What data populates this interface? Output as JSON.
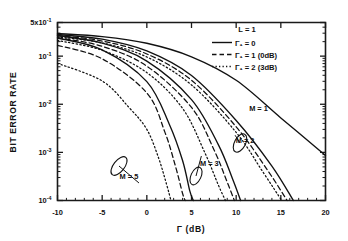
{
  "figure": {
    "background": "#ffffff",
    "ink_color": "#111111"
  },
  "chart_data": {
    "type": "line",
    "title": "",
    "xlabel": "Γ (dB)",
    "ylabel": "BIT ERROR RATE",
    "xlim": [
      -10,
      20
    ],
    "ylim": [
      0.0001,
      0.5
    ],
    "yscale": "log",
    "xticks": [
      -10,
      -5,
      0,
      5,
      10,
      15,
      20
    ],
    "xtick_labels": [
      "-10",
      "-5",
      "0",
      "5",
      "10",
      "15",
      "20"
    ],
    "ytick_values": [
      0.5,
      0.1,
      0.01,
      0.001,
      0.0001
    ],
    "ytick_labels": [
      "5x10",
      "10",
      "10",
      "10",
      "10"
    ],
    "ytick_exponents": [
      "-1",
      "-1",
      "-2",
      "-3",
      "-4"
    ],
    "grid": false,
    "legend_position": "top-right",
    "legend": {
      "header": "L = 1",
      "entries": [
        {
          "label": "Γ₁ = 0",
          "style": "solid"
        },
        {
          "label": "Γ₁ = 1 (0dB)",
          "style": "dashed"
        },
        {
          "label": "Γ₁ = 2 (3dB)",
          "style": "dotted"
        }
      ]
    },
    "annotations": [
      {
        "label": "M = 1",
        "x": 12.5,
        "y": 0.0072
      },
      {
        "label": "M = 2",
        "x": 11.0,
        "y": 0.00155
      },
      {
        "label": "M = 3",
        "x": 7.0,
        "y": 0.00052
      },
      {
        "label": "M = 5",
        "x": -2.0,
        "y": 0.00028
      }
    ],
    "series": [
      {
        "name": "M=1, Γ₁=0",
        "style": "solid",
        "group": "M=1",
        "points": [
          [
            -10,
            0.295
          ],
          [
            -5,
            0.255
          ],
          [
            0,
            0.185
          ],
          [
            5,
            0.097
          ],
          [
            10,
            0.0315
          ],
          [
            15,
            0.0052
          ],
          [
            20,
            0.00086
          ]
        ]
      },
      {
        "name": "M=2, Γ₁=0",
        "style": "solid",
        "group": "M=2",
        "points": [
          [
            -10,
            0.282
          ],
          [
            -5,
            0.225
          ],
          [
            0,
            0.128
          ],
          [
            5,
            0.0395
          ],
          [
            10,
            0.0046
          ],
          [
            14.0,
            0.00052
          ],
          [
            16.4,
            0.0001
          ]
        ]
      },
      {
        "name": "M=2, Γ₁=1",
        "style": "dashed",
        "group": "M=2",
        "points": [
          [
            -10,
            0.268
          ],
          [
            -5,
            0.206
          ],
          [
            0,
            0.111
          ],
          [
            5,
            0.0315
          ],
          [
            10,
            0.0034
          ],
          [
            13.5,
            0.00043
          ],
          [
            15.7,
            0.0001
          ]
        ]
      },
      {
        "name": "M=2, Γ₁=2",
        "style": "dotted",
        "group": "M=2",
        "points": [
          [
            -10,
            0.252
          ],
          [
            -5,
            0.188
          ],
          [
            0,
            0.096
          ],
          [
            5,
            0.0252
          ],
          [
            10,
            0.0026
          ],
          [
            13.0,
            0.00039
          ],
          [
            15.1,
            0.0001
          ]
        ]
      },
      {
        "name": "M=3, Γ₁=0",
        "style": "solid",
        "group": "M=3",
        "points": [
          [
            -10,
            0.268
          ],
          [
            -5,
            0.186
          ],
          [
            0,
            0.079
          ],
          [
            5,
            0.0125
          ],
          [
            8.0,
            0.00145
          ],
          [
            9.6,
            0.00028
          ],
          [
            10.5,
            0.0001
          ]
        ]
      },
      {
        "name": "M=3, Γ₁=1",
        "style": "dashed",
        "group": "M=3",
        "points": [
          [
            -10,
            0.242
          ],
          [
            -5,
            0.16
          ],
          [
            0,
            0.062
          ],
          [
            5,
            0.0086
          ],
          [
            7.5,
            0.00115
          ],
          [
            9.0,
            0.00024
          ],
          [
            9.8,
            0.0001
          ]
        ]
      },
      {
        "name": "M=3, Γ₁=2",
        "style": "dotted",
        "group": "M=3",
        "points": [
          [
            -10,
            0.212
          ],
          [
            -5,
            0.132
          ],
          [
            0,
            0.0455
          ],
          [
            4.0,
            0.0082
          ],
          [
            6.5,
            0.00098
          ],
          [
            8.0,
            0.00021
          ],
          [
            8.8,
            0.0001
          ]
        ]
      },
      {
        "name": "M=5, Γ₁=0",
        "style": "solid",
        "group": "M=5",
        "points": [
          [
            -10,
            0.238
          ],
          [
            -5,
            0.135
          ],
          [
            0,
            0.0295
          ],
          [
            2.5,
            0.0039
          ],
          [
            4.0,
            0.00068
          ],
          [
            4.8,
            0.00016
          ],
          [
            5.2,
            0.0001
          ]
        ]
      },
      {
        "name": "M=5, Γ₁=1",
        "style": "dashed",
        "group": "M=5",
        "points": [
          [
            -10,
            0.168
          ],
          [
            -5,
            0.088
          ],
          [
            0,
            0.0172
          ],
          [
            2.0,
            0.0027
          ],
          [
            3.2,
            0.00052
          ],
          [
            4.0,
            0.00014
          ],
          [
            4.3,
            0.0001
          ]
        ]
      },
      {
        "name": "M=5, Γ₁=2",
        "style": "dotted",
        "group": "M=5",
        "points": [
          [
            -10,
            0.071
          ],
          [
            -5,
            0.0305
          ],
          [
            -2.0,
            0.0086
          ],
          [
            0,
            0.003
          ],
          [
            1.3,
            0.00078
          ],
          [
            2.2,
            0.00022
          ],
          [
            2.7,
            0.0001
          ]
        ]
      }
    ]
  }
}
